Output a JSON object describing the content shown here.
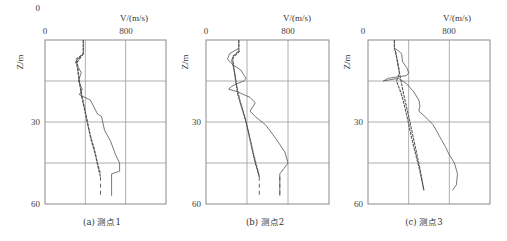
{
  "chart_data": [
    {
      "type": "line",
      "caption": "(a) 测点1",
      "xlabel": "V/(m/s)",
      "ylabel": "Z/m",
      "xlim": [
        0,
        1200
      ],
      "ylim": [
        0,
        60
      ],
      "y_inverted": true,
      "x_ticks": [
        0,
        800
      ],
      "y_ticks": [
        0,
        30,
        60
      ],
      "grid": true,
      "series": [
        {
          "name": "curve-wavy",
          "style": "thin",
          "points": [
            [
              380,
              0
            ],
            [
              380,
              5
            ],
            [
              300,
              8
            ],
            [
              330,
              10
            ],
            [
              360,
              12
            ],
            [
              330,
              15
            ],
            [
              370,
              18
            ],
            [
              340,
              20
            ],
            [
              450,
              22
            ],
            [
              520,
              27
            ],
            [
              560,
              28
            ],
            [
              590,
              33
            ],
            [
              650,
              37
            ],
            [
              700,
              42
            ],
            [
              740,
              45
            ],
            [
              740,
              48
            ],
            [
              660,
              49
            ],
            [
              660,
              54
            ],
            [
              660,
              57
            ]
          ]
        },
        {
          "name": "curve-smooth-1",
          "style": "thick",
          "points": [
            [
              380,
              0
            ],
            [
              380,
              5
            ],
            [
              310,
              7
            ],
            [
              320,
              10
            ],
            [
              340,
              15
            ],
            [
              360,
              20
            ],
            [
              390,
              25
            ],
            [
              420,
              30
            ],
            [
              450,
              35
            ],
            [
              490,
              40
            ],
            [
              520,
              45
            ],
            [
              550,
              49
            ]
          ]
        },
        {
          "name": "curve-smooth-2",
          "style": "thick",
          "points": [
            [
              380,
              5
            ],
            [
              320,
              8
            ],
            [
              330,
              12
            ],
            [
              350,
              17
            ],
            [
              375,
              22
            ],
            [
              405,
              27
            ],
            [
              430,
              32
            ],
            [
              460,
              37
            ],
            [
              500,
              42
            ],
            [
              530,
              47
            ],
            [
              550,
              50
            ]
          ]
        },
        {
          "name": "curve-dashed",
          "style": "dashed",
          "points": [
            [
              550,
              50
            ],
            [
              550,
              57
            ]
          ]
        }
      ]
    },
    {
      "type": "line",
      "caption": "(b) 测点2",
      "xlabel": "V/(m/s)",
      "ylabel": "Z/m",
      "xlim": [
        0,
        1200
      ],
      "ylim": [
        0,
        60
      ],
      "y_inverted": true,
      "x_ticks": [
        0,
        800
      ],
      "y_ticks": [
        0,
        30,
        60
      ],
      "grid": true,
      "series": [
        {
          "name": "curve-wavy",
          "style": "thin",
          "points": [
            [
              320,
              0
            ],
            [
              320,
              3
            ],
            [
              230,
              5
            ],
            [
              210,
              7
            ],
            [
              260,
              9
            ],
            [
              340,
              11
            ],
            [
              390,
              14
            ],
            [
              370,
              15
            ],
            [
              300,
              16
            ],
            [
              250,
              17
            ],
            [
              220,
              18
            ],
            [
              310,
              19
            ],
            [
              370,
              20
            ],
            [
              430,
              21
            ],
            [
              480,
              23
            ],
            [
              430,
              26
            ],
            [
              480,
              28
            ],
            [
              580,
              31
            ],
            [
              680,
              36
            ],
            [
              770,
              41
            ],
            [
              800,
              45
            ],
            [
              760,
              47
            ],
            [
              720,
              49
            ],
            [
              720,
              53
            ],
            [
              720,
              57
            ]
          ]
        },
        {
          "name": "curve-smooth-1",
          "style": "thick",
          "points": [
            [
              320,
              0
            ],
            [
              320,
              4
            ],
            [
              260,
              6
            ],
            [
              270,
              10
            ],
            [
              290,
              15
            ],
            [
              310,
              20
            ],
            [
              350,
              25
            ],
            [
              390,
              30
            ],
            [
              420,
              35
            ],
            [
              450,
              40
            ],
            [
              480,
              45
            ],
            [
              520,
              50
            ]
          ]
        },
        {
          "name": "curve-smooth-2",
          "style": "thick",
          "points": [
            [
              330,
              4
            ],
            [
              250,
              7
            ],
            [
              280,
              12
            ],
            [
              300,
              17
            ],
            [
              330,
              22
            ],
            [
              370,
              27
            ],
            [
              405,
              32
            ],
            [
              435,
              37
            ],
            [
              465,
              42
            ],
            [
              500,
              47
            ],
            [
              520,
              50
            ]
          ]
        },
        {
          "name": "curve-dashed-1",
          "style": "dashed",
          "points": [
            [
              520,
              50
            ],
            [
              520,
              57
            ]
          ]
        },
        {
          "name": "curve-dashed-2",
          "style": "dashed",
          "points": [
            [
              720,
              50
            ],
            [
              720,
              57
            ]
          ]
        }
      ]
    },
    {
      "type": "line",
      "caption": "(c) 测点3",
      "xlabel": "V/(m/s)",
      "ylabel": "Z/m",
      "xlim": [
        0,
        1200
      ],
      "ylim": [
        0,
        60
      ],
      "y_inverted": true,
      "x_ticks": [
        0,
        800
      ],
      "y_ticks": [
        0,
        30,
        60
      ],
      "grid": true,
      "series": [
        {
          "name": "curve-wavy",
          "style": "thin",
          "points": [
            [
              260,
              0
            ],
            [
              260,
              3
            ],
            [
              300,
              4
            ],
            [
              330,
              5
            ],
            [
              340,
              8
            ],
            [
              380,
              10
            ],
            [
              400,
              12
            ],
            [
              380,
              13
            ],
            [
              200,
              14
            ],
            [
              150,
              15
            ],
            [
              300,
              14
            ],
            [
              380,
              16
            ],
            [
              450,
              19
            ],
            [
              500,
              22
            ],
            [
              510,
              24
            ],
            [
              500,
              26
            ],
            [
              560,
              28
            ],
            [
              640,
              31
            ],
            [
              700,
              35
            ],
            [
              760,
              39
            ],
            [
              800,
              42
            ],
            [
              850,
              45
            ],
            [
              880,
              49
            ],
            [
              870,
              53
            ],
            [
              830,
              55
            ]
          ]
        },
        {
          "name": "curve-smooth-1",
          "style": "thick",
          "points": [
            [
              260,
              0
            ],
            [
              260,
              3
            ],
            [
              280,
              6
            ],
            [
              300,
              10
            ],
            [
              320,
              14
            ],
            [
              340,
              18
            ],
            [
              370,
              23
            ],
            [
              400,
              28
            ],
            [
              430,
              33
            ],
            [
              470,
              40
            ],
            [
              510,
              47
            ],
            [
              550,
              55
            ]
          ]
        },
        {
          "name": "curve-smooth-2",
          "style": "thick",
          "points": [
            [
              270,
              4
            ],
            [
              290,
              8
            ],
            [
              310,
              12
            ],
            [
              280,
              15
            ],
            [
              330,
              20
            ],
            [
              365,
              25
            ],
            [
              395,
              30
            ],
            [
              430,
              36
            ],
            [
              470,
              42
            ],
            [
              510,
              48
            ],
            [
              550,
              55
            ]
          ]
        }
      ]
    }
  ],
  "panels": [
    {
      "caption": "(a) 测点1",
      "x0": "0",
      "x800": "800",
      "y0": "0",
      "y30": "30",
      "y60": "60",
      "xlabel": "V/(m/s)",
      "ylabel": "Z/m"
    },
    {
      "caption": "(b) 测点2",
      "x0": "0",
      "x800": "800",
      "y0": "0",
      "y30": "30",
      "y60": "60",
      "xlabel": "V/(m/s)",
      "ylabel": "Z/m"
    },
    {
      "caption": "(c) 测点3",
      "x0": "0",
      "x800": "800",
      "y0": "0",
      "y30": "30",
      "y60": "60",
      "xlabel": "V/(m/s)",
      "ylabel": "Z/m"
    }
  ],
  "colors": {
    "line": "#555555",
    "grid": "#9a9a9a",
    "frame": "#8a8a8a"
  }
}
